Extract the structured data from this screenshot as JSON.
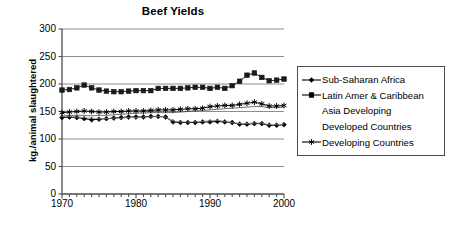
{
  "chart_data": {
    "type": "line",
    "title": "Beef Yields",
    "xlabel": "",
    "ylabel": "kg./animal slaughtered",
    "xlim": [
      1970,
      2000
    ],
    "ylim": [
      0,
      300
    ],
    "yticks": [
      0,
      50,
      100,
      150,
      200,
      250,
      300
    ],
    "xticks": [
      1970,
      1980,
      1990,
      2000
    ],
    "xtick_interval_minor": 1,
    "grid": "horizontal",
    "legend_position": "right",
    "x": [
      1970,
      1971,
      1972,
      1973,
      1974,
      1975,
      1976,
      1977,
      1978,
      1979,
      1980,
      1981,
      1982,
      1983,
      1984,
      1985,
      1986,
      1987,
      1988,
      1989,
      1990,
      1991,
      1992,
      1993,
      1994,
      1995,
      1996,
      1997,
      1998,
      1999,
      2000
    ],
    "series": [
      {
        "name": "Sub-Saharan Africa",
        "marker": "diamond",
        "color": "#000000",
        "values": [
          139,
          140,
          139,
          137,
          135,
          136,
          137,
          138,
          139,
          140,
          140,
          140,
          141,
          141,
          140,
          131,
          130,
          130,
          130,
          131,
          131,
          132,
          131,
          130,
          127,
          127,
          128,
          128,
          125,
          125,
          126
        ]
      },
      {
        "name": "Latin Amer & Caribbean",
        "marker": "square",
        "color": "#1a1a1a",
        "values": [
          189,
          190,
          193,
          198,
          193,
          189,
          187,
          186,
          186,
          187,
          188,
          188,
          188,
          192,
          192,
          192,
          192,
          193,
          194,
          194,
          192,
          194,
          192,
          197,
          205,
          216,
          220,
          212,
          206,
          207,
          209
        ]
      },
      {
        "name": "Asia Developing",
        "marker": "none",
        "color": "#4d4d4d",
        "values": [
          142,
          143,
          143,
          143,
          142,
          143,
          143,
          144,
          145,
          146,
          147,
          147,
          148,
          148,
          148,
          148,
          149,
          150,
          151,
          152,
          153,
          154,
          155,
          156,
          157,
          158,
          159,
          159,
          157,
          157,
          158
        ]
      },
      {
        "name": "Developed Countries",
        "marker": "none",
        "color": "#8c8c8c",
        "values": [
          141,
          141,
          140,
          139,
          138,
          137,
          137,
          138,
          138,
          139,
          139,
          140,
          140,
          141,
          140,
          133,
          131,
          131,
          131,
          132,
          133,
          134,
          132,
          130,
          128,
          128,
          129,
          129,
          126,
          126,
          127
        ]
      },
      {
        "name": "Developing Countries",
        "marker": "star",
        "color": "#000000",
        "values": [
          148,
          149,
          150,
          151,
          150,
          149,
          149,
          150,
          150,
          151,
          151,
          151,
          152,
          153,
          153,
          153,
          154,
          155,
          155,
          156,
          159,
          160,
          161,
          161,
          163,
          165,
          167,
          164,
          160,
          160,
          161
        ]
      }
    ]
  },
  "legend": {
    "entries": [
      {
        "label": "Sub-Saharan Africa",
        "marker": "diamond"
      },
      {
        "label": "Latin Amer & Caribbean",
        "marker": "square"
      },
      {
        "label": "Asia Developing",
        "marker": "none"
      },
      {
        "label": "Developed Countries",
        "marker": "none"
      },
      {
        "label": "Developing Countries",
        "marker": "star"
      }
    ]
  },
  "axes": {
    "y_labels": [
      "300",
      "250",
      "200",
      "150",
      "100",
      "50",
      "0"
    ],
    "x_labels": [
      "1970",
      "1980",
      "1990",
      "2000"
    ]
  },
  "colors": {
    "axis": "#4d4d4d",
    "grid": "#808080",
    "text": "#000000",
    "series_dark": "#000000",
    "series_mid": "#4d4d4d",
    "series_light": "#8c8c8c"
  }
}
